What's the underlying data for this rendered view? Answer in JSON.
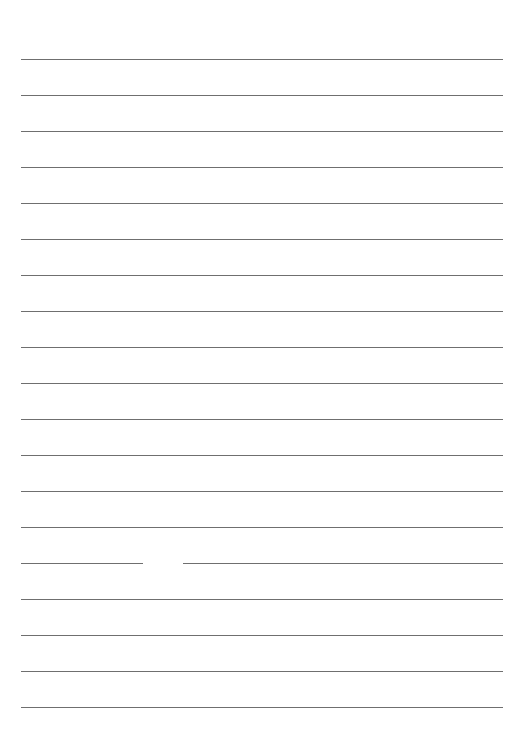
{
  "page": {
    "type": "lined-paper",
    "line_count": 19,
    "line_color": "#6f6f6f",
    "first_line_y": 59,
    "line_spacing": 36,
    "line_left": 21,
    "line_width": 482,
    "gaps": [
      {
        "line_index": 14,
        "x": 143,
        "width": 40
      }
    ]
  }
}
